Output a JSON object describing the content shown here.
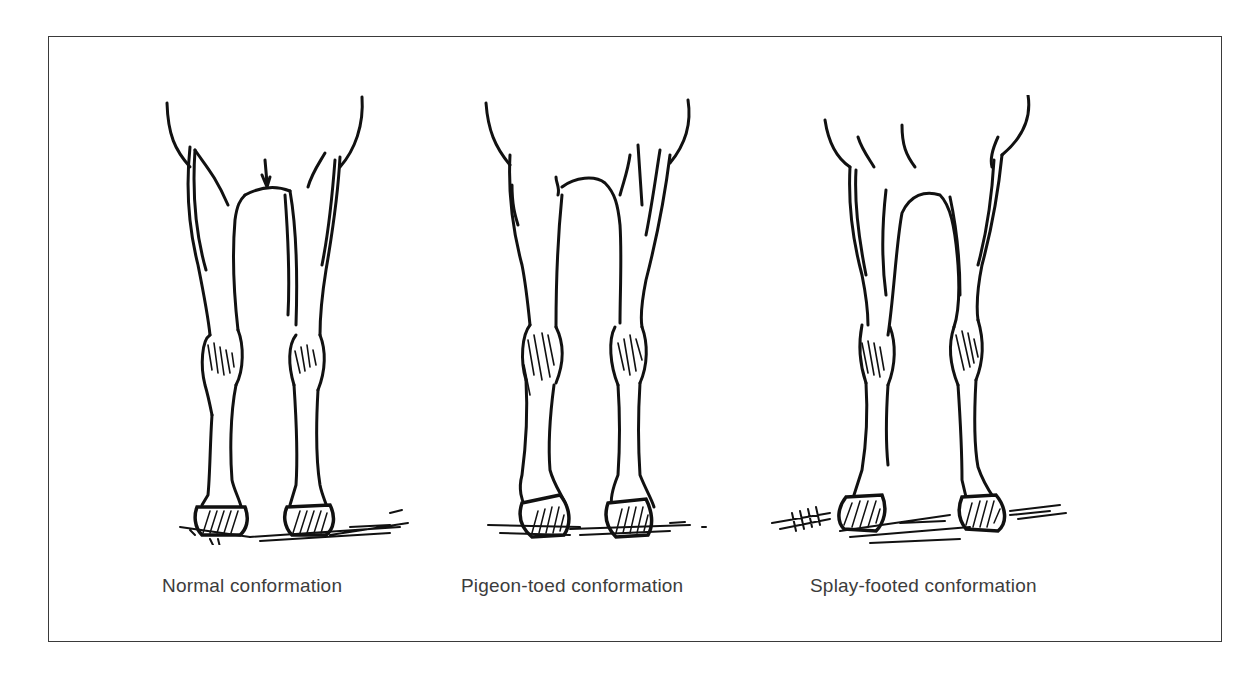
{
  "figure": {
    "panels": [
      {
        "id": "normal",
        "caption": "Normal conformation",
        "icon": "normal-legs-illustration"
      },
      {
        "id": "pigeon-toed",
        "caption": "Pigeon-toed conformation",
        "icon": "pigeon-toed-legs-illustration"
      },
      {
        "id": "splay-footed",
        "caption": "Splay-footed conformation",
        "icon": "splay-footed-legs-illustration"
      }
    ]
  },
  "colors": {
    "ink": "#111111",
    "caption": "#3c3c3c",
    "frame": "#3a3a3a",
    "background": "#ffffff"
  }
}
